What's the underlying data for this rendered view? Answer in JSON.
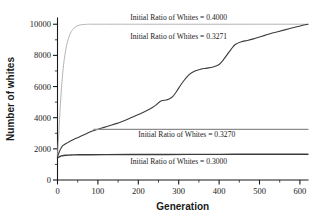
{
  "chart_data": {
    "type": "line",
    "title": "",
    "subtitle": "",
    "xlabel": "Generation",
    "ylabel": "Number of whites",
    "xlim": [
      0,
      620
    ],
    "ylim": [
      0,
      10400
    ],
    "xticks": [
      0,
      100,
      200,
      300,
      400,
      500,
      600
    ],
    "xticklabels": [
      "0",
      "100",
      "200",
      "300",
      "400",
      "500",
      "600"
    ],
    "xminorticks": [
      50,
      150,
      250,
      350,
      450,
      550
    ],
    "yticks": [
      0,
      2000,
      4000,
      6000,
      8000,
      10000
    ],
    "yticklabels": [
      "0",
      "2000",
      "4000",
      "6000",
      "8000",
      "10000"
    ],
    "yminorticks": [
      1000,
      3000,
      5000,
      7000,
      9000
    ],
    "grid": false,
    "legend_position": "inline-annotations",
    "series": [
      {
        "name": "Initial Ratio of Whites = 0.4000",
        "color": "#b4b4b4",
        "linewidth": 1.0,
        "annotation": "Initial Ratio of Whites = 0.4000",
        "annotation_x": 300,
        "annotation_y": 10300,
        "x": [
          0,
          2,
          4,
          6,
          8,
          10,
          12,
          14,
          16,
          18,
          20,
          23,
          26,
          30,
          34,
          38,
          42,
          46,
          50,
          55,
          60,
          70,
          80,
          100,
          150,
          200,
          300,
          400,
          500,
          620
        ],
        "y": [
          1500,
          2400,
          3400,
          4350,
          5200,
          5950,
          6600,
          7150,
          7600,
          7980,
          8300,
          8700,
          9000,
          9300,
          9520,
          9670,
          9780,
          9860,
          9910,
          9950,
          9970,
          9990,
          10000,
          10000,
          10000,
          10000,
          10000,
          10000,
          10000,
          10000
        ]
      },
      {
        "name": "Initial Ratio of Whites = 0.3271",
        "color": "#3c3c3c",
        "linewidth": 1.1,
        "annotation": "Initial Ratio of Whites = 0.3271",
        "annotation_x": 300,
        "annotation_y": 9050,
        "x": [
          0,
          3,
          6,
          9,
          12,
          16,
          20,
          25,
          30,
          40,
          50,
          60,
          70,
          80,
          90,
          100,
          115,
          130,
          145,
          160,
          175,
          190,
          205,
          220,
          235,
          245,
          255,
          265,
          275,
          285,
          295,
          305,
          315,
          325,
          340,
          355,
          370,
          385,
          400,
          410,
          420,
          430,
          440,
          455,
          470,
          485,
          500,
          515,
          530,
          545,
          560,
          575,
          590,
          605,
          620
        ],
        "y": [
          1500,
          1700,
          1900,
          2060,
          2180,
          2260,
          2330,
          2400,
          2470,
          2600,
          2720,
          2840,
          2960,
          3080,
          3180,
          3260,
          3380,
          3500,
          3620,
          3760,
          3920,
          4090,
          4260,
          4440,
          4660,
          4840,
          5060,
          5120,
          5180,
          5350,
          5700,
          6100,
          6450,
          6750,
          7000,
          7120,
          7180,
          7260,
          7420,
          7700,
          8050,
          8400,
          8700,
          8880,
          8960,
          9060,
          9180,
          9300,
          9420,
          9520,
          9620,
          9720,
          9820,
          9920,
          10000
        ]
      },
      {
        "name": "Initial Ratio of Whites = 0.3270",
        "color": "#8c8c8c",
        "linewidth": 1.1,
        "annotation": "Initial Ratio of Whites = 0.3270",
        "annotation_x": 320,
        "annotation_y": 2750,
        "x": [
          90,
          120,
          160,
          200,
          250,
          300,
          350,
          400,
          450,
          500,
          550,
          620
        ],
        "y": [
          3250,
          3250,
          3250,
          3250,
          3250,
          3250,
          3250,
          3250,
          3250,
          3250,
          3250,
          3250
        ]
      },
      {
        "name": "Initial Ratio of Whites = 0.3000",
        "color": "#3c3c3c",
        "linewidth": 1.4,
        "annotation": "Initial Ratio of Whites = 0.3000",
        "annotation_x": 300,
        "annotation_y": 1050,
        "x": [
          0,
          3,
          6,
          10,
          15,
          20,
          30,
          40,
          60,
          80,
          120,
          180,
          250,
          320,
          400,
          480,
          560,
          620
        ],
        "y": [
          1420,
          1470,
          1510,
          1545,
          1570,
          1585,
          1600,
          1610,
          1620,
          1625,
          1630,
          1635,
          1640,
          1645,
          1648,
          1650,
          1652,
          1655
        ]
      }
    ]
  },
  "axes": {
    "x_title": "Generation",
    "y_title": "Number of whites"
  }
}
